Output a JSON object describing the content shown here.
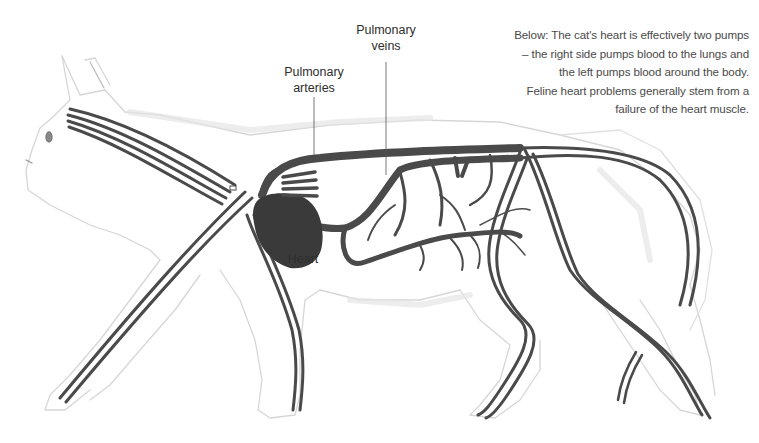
{
  "figure": {
    "caption_lines": [
      "Below: The cat's heart is effectively two pumps",
      "– the right side pumps blood to the lungs and",
      "the left pumps blood around the body.",
      "Feline heart problems generally stem from a",
      "failure of the heart muscle."
    ],
    "labels": {
      "pulmonary_veins": [
        "Pulmonary",
        "veins"
      ],
      "pulmonary_arteries": [
        "Pulmonary",
        "arteries"
      ],
      "heart": "Heart"
    },
    "colors": {
      "vessel": "#4a4a4a",
      "heart": "#3a3a3a",
      "outline": "#cfcfcf",
      "text": "#333333",
      "background": "#ffffff"
    }
  }
}
